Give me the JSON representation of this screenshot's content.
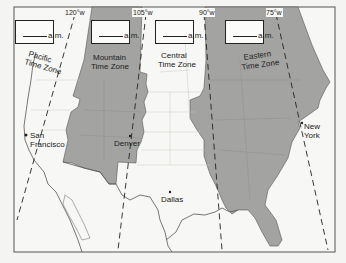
{
  "map": {
    "title": "U.S. Time Zones",
    "frame": {
      "x": 14,
      "y": 7,
      "width": 321,
      "height": 245
    },
    "colors": {
      "background": "#f4f4f2",
      "shaded_zone": "#a3a3a1",
      "unshaded_zone": "#f7f7f5",
      "borders": "#555555",
      "meridians": "#222222"
    },
    "meridians": [
      {
        "label": "120°w",
        "x_top": 75
      },
      {
        "label": "105°w",
        "x_top": 146
      },
      {
        "label": "90°w",
        "x_top": 204
      },
      {
        "label": "75°w",
        "x_top": 276
      }
    ],
    "time_zones": [
      {
        "name": "pacific",
        "label_line1": "Pacific",
        "label_line2": "Time Zone",
        "shaded": false,
        "answer_blank": "",
        "answer_suffix": "a.m."
      },
      {
        "name": "mountain",
        "label_line1": "Mountain",
        "label_line2": "Time Zone",
        "shaded": true,
        "answer_blank": "",
        "answer_suffix": "a.m."
      },
      {
        "name": "central",
        "label_line1": "Central",
        "label_line2": "Time Zone",
        "shaded": false,
        "answer_blank": "",
        "answer_suffix": "a.m."
      },
      {
        "name": "eastern",
        "label_line1": "Eastern",
        "label_line2": "Time Zone",
        "shaded": true,
        "answer_blank": "",
        "answer_suffix": "a.m."
      }
    ],
    "cities": [
      {
        "name_line1": "San",
        "name_line2": "Francisco",
        "x": 25,
        "y": 136
      },
      {
        "name_line1": "Denver",
        "name_line2": "",
        "x": 131,
        "y": 136
      },
      {
        "name_line1": "Dallas",
        "name_line2": "",
        "x": 170,
        "y": 192
      },
      {
        "name_line1": "New",
        "name_line2": "York",
        "x": 302,
        "y": 124
      }
    ]
  }
}
